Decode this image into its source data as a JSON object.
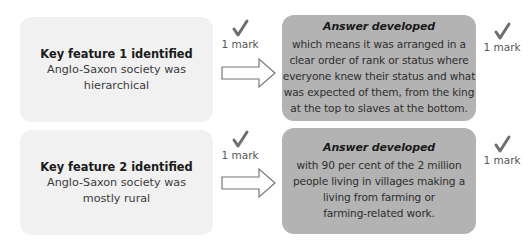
{
  "rows": [
    {
      "feature": {
        "title": "Key feature 1 identified",
        "body": "Anglo-Saxon society was\nhierarchical"
      },
      "feature_mark": "1 mark",
      "answer": {
        "title": "Answer developed",
        "body": "which means it was arranged in a\nclear order of rank or status where\neveryone knew their status and what\nwas expected of them, from the king\nat the top to slaves at the bottom."
      },
      "answer_mark": "1 mark"
    },
    {
      "feature": {
        "title": "Key feature 2 identified",
        "body": "Anglo-Saxon society was\nmostly rural"
      },
      "feature_mark": "1 mark",
      "answer": {
        "title": "Answer developed",
        "body": "with 90 per cent of the 2 million\npeople living in villages making a\nliving from farming or\nfarming-related work."
      },
      "answer_mark": "1 mark"
    }
  ],
  "icons": {
    "tick": "check-icon",
    "arrow": "right-arrow-icon"
  },
  "colors": {
    "feature_box": "#f1f1f1",
    "answer_box": "#b3b3b3",
    "tick": "#6e6e6e"
  }
}
